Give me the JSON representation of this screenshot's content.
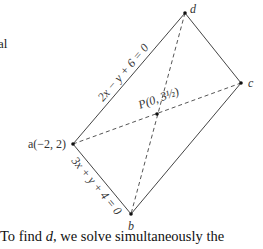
{
  "page_fragment_top": "al",
  "diagram": {
    "vertices": {
      "a": {
        "label": "a(−2, 2)"
      },
      "b": {
        "label": "b"
      },
      "c": {
        "label": "c"
      },
      "d": {
        "label": "d"
      },
      "p": {
        "label": "P(0, 3½)"
      }
    },
    "edge_labels": {
      "ad": "2x − y + 6 = 0",
      "ab": "3x + y + 4 = 0"
    }
  },
  "caption": {
    "prefix": "To find ",
    "var": "d",
    "suffix": ", we solve simultaneously the"
  }
}
